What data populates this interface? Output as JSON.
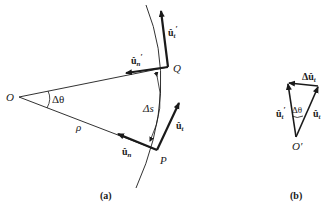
{
  "diagram": {
    "panel_a": {
      "caption": "(a)",
      "center_label": "O",
      "point_p": "P",
      "point_q": "Q",
      "angle_label": "Δθ",
      "radius_label": "ρ",
      "arc_label": "Δs",
      "vectors": {
        "ut_prime": {
          "base": "û",
          "sub": "t",
          "prime": "′"
        },
        "un_prime": {
          "base": "û",
          "sub": "n",
          "prime": "′"
        },
        "ut": {
          "base": "û",
          "sub": "t"
        },
        "un": {
          "base": "û",
          "sub": "n"
        }
      }
    },
    "panel_b": {
      "caption": "(b)",
      "origin_label": "O′",
      "angle_label": "Δθ",
      "vectors": {
        "delta_ut": {
          "prefix": "Δ",
          "base": "û",
          "sub": "t"
        },
        "ut_prime": {
          "base": "û",
          "sub": "t",
          "prime": "′"
        },
        "ut": {
          "base": "û",
          "sub": "t"
        }
      }
    },
    "colors": {
      "line": "#1a1a1a",
      "background": "#ffffff"
    }
  }
}
